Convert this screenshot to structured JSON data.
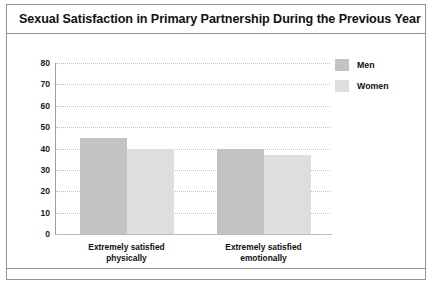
{
  "figure": {
    "title": "Sexual Satisfaction in Primary Partnership During the Previous Year"
  },
  "legend": {
    "items": [
      {
        "label": "Men",
        "color": "#c3c3c3",
        "swatch_name": "legend-swatch-men"
      },
      {
        "label": "Women",
        "color": "#dedede",
        "swatch_name": "legend-swatch-women"
      }
    ]
  },
  "chart_data": {
    "type": "bar",
    "title": "Sexual Satisfaction in Primary Partnership During the Previous Year",
    "xlabel": "",
    "ylabel": "",
    "categories": [
      "Extremely satisfied physically",
      "Extremely satisfied emotionally"
    ],
    "category_lines": [
      [
        "Extremely satisfied",
        "physically"
      ],
      [
        "Extremely satisfied",
        "emotionally"
      ]
    ],
    "series": [
      {
        "name": "Men",
        "color": "#c3c3c3",
        "values": [
          45,
          40
        ]
      },
      {
        "name": "Women",
        "color": "#dedede",
        "values": [
          40,
          37
        ]
      }
    ],
    "ylim": [
      0,
      80
    ],
    "ytick_step": 10,
    "yticks": [
      "80",
      "70",
      "60",
      "50",
      "40",
      "30",
      "20",
      "10",
      "0"
    ],
    "ytick_values": [
      80,
      70,
      60,
      50,
      40,
      30,
      20,
      10,
      0
    ],
    "grid": true,
    "grid_style": "dotted",
    "legend_position": "top-right"
  }
}
